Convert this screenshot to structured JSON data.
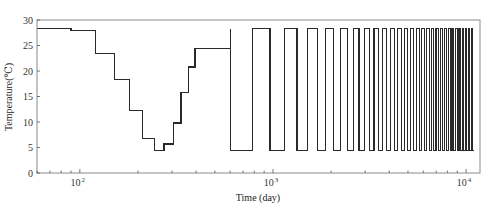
{
  "chart_data": {
    "type": "line",
    "subtype": "step",
    "title": "",
    "xlabel": "Time (day)",
    "ylabel": "Temperature(℃)",
    "xscale": "log",
    "xlim": [
      60,
      11800
    ],
    "ylim": [
      0,
      30
    ],
    "yticks": [
      0,
      5,
      10,
      15,
      20,
      25,
      30
    ],
    "ytick_labels": [
      "0",
      "5",
      "10",
      "15",
      "20",
      "25",
      "30"
    ],
    "xticks_major": [
      100,
      1000,
      10000
    ],
    "xtick_labels": [
      {
        "base": "10",
        "exp": "2"
      },
      {
        "base": "10",
        "exp": "3"
      },
      {
        "base": "10",
        "exp": "4"
      }
    ],
    "grid": false,
    "legend": null,
    "series": [
      {
        "name": "Temperature",
        "color": "#2a2a2a",
        "monthly_steps": {
          "description": "Monthly step values from day 60 to ~600",
          "x": [
            60,
            90,
            121,
            151,
            181,
            212,
            243,
            273,
            304,
            334,
            365,
            395,
            600
          ],
          "y": [
            28.3,
            27.9,
            23.4,
            18.3,
            12.3,
            6.8,
            4.4,
            5.7,
            9.8,
            15.8,
            20.8,
            24.4,
            28.3
          ]
        },
        "periodic_steps": {
          "description": "Alternating half-year low/high pattern from day ~600 to ~11000",
          "start_day": 600,
          "end_day": 10950,
          "half_period_days": 182.5,
          "low": 4.4,
          "high": 28.3,
          "first_level": "low"
        }
      }
    ]
  }
}
